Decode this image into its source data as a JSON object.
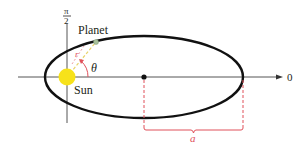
{
  "diagram": {
    "labels": {
      "pi_numerator": "π",
      "pi_denominator": "2",
      "planet": "Planet",
      "sun": "Sun",
      "theta": "θ",
      "r": "r",
      "zero": "0",
      "semi_major_axis": "a"
    },
    "elements": {
      "ellipse": {
        "cx": 144,
        "cy": 77,
        "rx": 99,
        "ry": 41
      },
      "sun": {
        "cx": 67,
        "cy": 77,
        "r": 8
      },
      "planet": {
        "cx": 96,
        "cy": 42
      },
      "center_point": {
        "cx": 144,
        "cy": 77
      }
    },
    "colors": {
      "axis": "#555555",
      "orbit": "#111111",
      "sun": "#f7e21a",
      "annotation": "#e0505a",
      "radius_line": "#e8d36a",
      "planet": "#a9c19a",
      "text": "#231f20"
    }
  }
}
